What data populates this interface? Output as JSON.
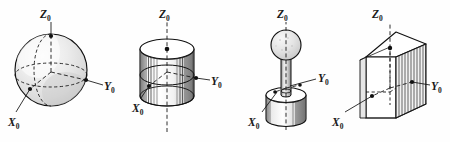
{
  "figure": {
    "title_text": "",
    "background_color": "#fefefe",
    "ink_color": "#111111",
    "shade_color": "#d9d9d9",
    "panel_count": 4,
    "panels": [
      {
        "id": "sphere",
        "shape_name": "sphere",
        "labels": {
          "z": "Z",
          "z_sub": "0",
          "y": "Y",
          "y_sub": "0",
          "x": "X",
          "x_sub": "0"
        }
      },
      {
        "id": "cylinder",
        "shape_name": "cylinder",
        "labels": {
          "z": "Z",
          "z_sub": "0",
          "y": "Y",
          "y_sub": "0",
          "x": "X",
          "x_sub": "0"
        }
      },
      {
        "id": "ball-on-shaft",
        "shape_name": "sphere-on-cylindrical-base",
        "labels": {
          "z": "Z",
          "z_sub": "0",
          "y": "Y",
          "y_sub": "0",
          "x": "X",
          "x_sub": "0"
        }
      },
      {
        "id": "cube",
        "shape_name": "cube",
        "labels": {
          "z": "Z",
          "z_sub": "0",
          "y": "Y",
          "y_sub": "0",
          "x": "X",
          "x_sub": "0"
        }
      }
    ]
  }
}
